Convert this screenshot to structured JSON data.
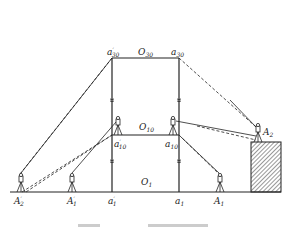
{
  "diagram": {
    "type": "surveying-diagram",
    "labels": {
      "a30_prime": {
        "base": "a",
        "sup": "′",
        "sub": "30"
      },
      "O30": {
        "base": "O",
        "sub": "30"
      },
      "a30": {
        "base": "a",
        "sub": "30"
      },
      "O10": {
        "base": "O",
        "sub": "10"
      },
      "a10_prime": {
        "base": "a",
        "sup": "′",
        "sub": "10"
      },
      "a10": {
        "base": "a",
        "sub": "10"
      },
      "A2": {
        "base": "A",
        "sub": "2"
      },
      "O1": {
        "base": "O",
        "sub": "1"
      },
      "A2_prime": {
        "base": "A",
        "sup": "′",
        "sub": "2"
      },
      "A1_prime": {
        "base": "A",
        "sup": "′",
        "sub": "1"
      },
      "a1_prime": {
        "base": "a",
        "sup": "′",
        "sub": "1"
      },
      "a1": {
        "base": "a",
        "sub": "1"
      },
      "A1": {
        "base": "A",
        "sub": "1"
      }
    },
    "caption": "",
    "colors": {
      "line": "#222222",
      "hatch": "#333333",
      "background": "#ffffff"
    }
  }
}
